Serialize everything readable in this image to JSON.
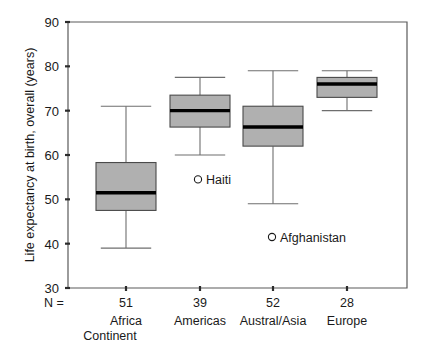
{
  "chart_data": {
    "type": "box",
    "title": "",
    "xlabel": "Continent",
    "ylabel": "Life expectancy at birth, overall (years)",
    "ylim": [
      30,
      90
    ],
    "yticks": [
      30,
      40,
      50,
      60,
      70,
      80,
      90
    ],
    "ytick_labels": [
      "30",
      "40",
      "50",
      "60",
      "70",
      "80",
      "90"
    ],
    "grid": false,
    "legend": "none",
    "n_prefix": "N =",
    "categories": [
      "Africa",
      "Americas",
      "Austral/Asia",
      "Europe"
    ],
    "n_values": [
      "51",
      "39",
      "52",
      "28"
    ],
    "boxes": [
      {
        "category": "Africa",
        "n": "51",
        "whisker_low": 39.0,
        "q1": 47.5,
        "median": 51.5,
        "q3": 58.3,
        "whisker_high": 71.0
      },
      {
        "category": "Americas",
        "n": "39",
        "whisker_low": 60.0,
        "q1": 66.3,
        "median": 70.0,
        "q3": 73.5,
        "whisker_high": 77.5
      },
      {
        "category": "Austral/Asia",
        "n": "52",
        "whisker_low": 49.0,
        "q1": 62.0,
        "median": 66.3,
        "q3": 71.0,
        "whisker_high": 79.0
      },
      {
        "category": "Europe",
        "n": "28",
        "whisker_low": 70.0,
        "q1": 73.0,
        "median": 76.0,
        "q3": 77.5,
        "whisker_high": 79.0
      }
    ],
    "outliers": [
      {
        "label": "Haiti",
        "category": "Americas",
        "value": 54.5
      },
      {
        "label": "Afghanistan",
        "category": "Austral/Asia",
        "value": 41.5
      }
    ],
    "colors": {
      "box_fill": "#b0b0b0",
      "box_stroke": "#4a4a4a",
      "median": "#000000",
      "whisker": "#6e6e6e",
      "axis": "#5a5a5a",
      "text": "#1a1a1a",
      "background": "#ffffff"
    }
  }
}
